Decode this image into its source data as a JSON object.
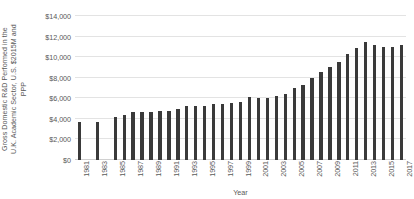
{
  "chart_data": {
    "type": "bar",
    "title": "",
    "xlabel": "Year",
    "ylabel": "Gross Domestic R&D Performed in the U.K. Academic Sector, U.S. $2015M and PPP",
    "ylabel_lines": [
      "Gross Domestic R&D Performed in the",
      "U.K. Academic Sector, U.S. $2015M and",
      "PPP"
    ],
    "ylim": [
      0,
      14000
    ],
    "ytick_values": [
      0,
      2000,
      4000,
      6000,
      8000,
      10000,
      12000,
      14000
    ],
    "ytick_labels": [
      "$0",
      "$2,000",
      "$4,000",
      "$6,000",
      "$8,000",
      "$10,000",
      "$12,000",
      "$14,000"
    ],
    "grid": true,
    "legend": false,
    "bar_color": "#3a3a3a",
    "gridline_color": "#e3e3e3",
    "text_color": "#595959",
    "categories": [
      "1981",
      "1982",
      "1983",
      "1984",
      "1985",
      "1986",
      "1987",
      "1988",
      "1989",
      "1990",
      "1991",
      "1992",
      "1993",
      "1994",
      "1995",
      "1996",
      "1997",
      "1998",
      "1999",
      "2000",
      "2001",
      "2002",
      "2003",
      "2004",
      "2005",
      "2006",
      "2007",
      "2008",
      "2009",
      "2010",
      "2011",
      "2012",
      "2013",
      "2014",
      "2015",
      "2016",
      "2017"
    ],
    "values": [
      3650,
      null,
      3700,
      null,
      4200,
      4350,
      4650,
      4700,
      4700,
      4750,
      4800,
      5000,
      5250,
      5300,
      5300,
      5400,
      5450,
      5500,
      5600,
      6150,
      6050,
      6050,
      6200,
      6450,
      7000,
      7300,
      8000,
      8600,
      9000,
      9500,
      10300,
      10900,
      11500,
      11150,
      11000,
      10950,
      11200
    ],
    "xtick_labels": [
      "1981",
      "1983",
      "1985",
      "1987",
      "1989",
      "1991",
      "1993",
      "1995",
      "1997",
      "1999",
      "2001",
      "2003",
      "2005",
      "2007",
      "2009",
      "2011",
      "2013",
      "2015",
      "2017"
    ]
  }
}
